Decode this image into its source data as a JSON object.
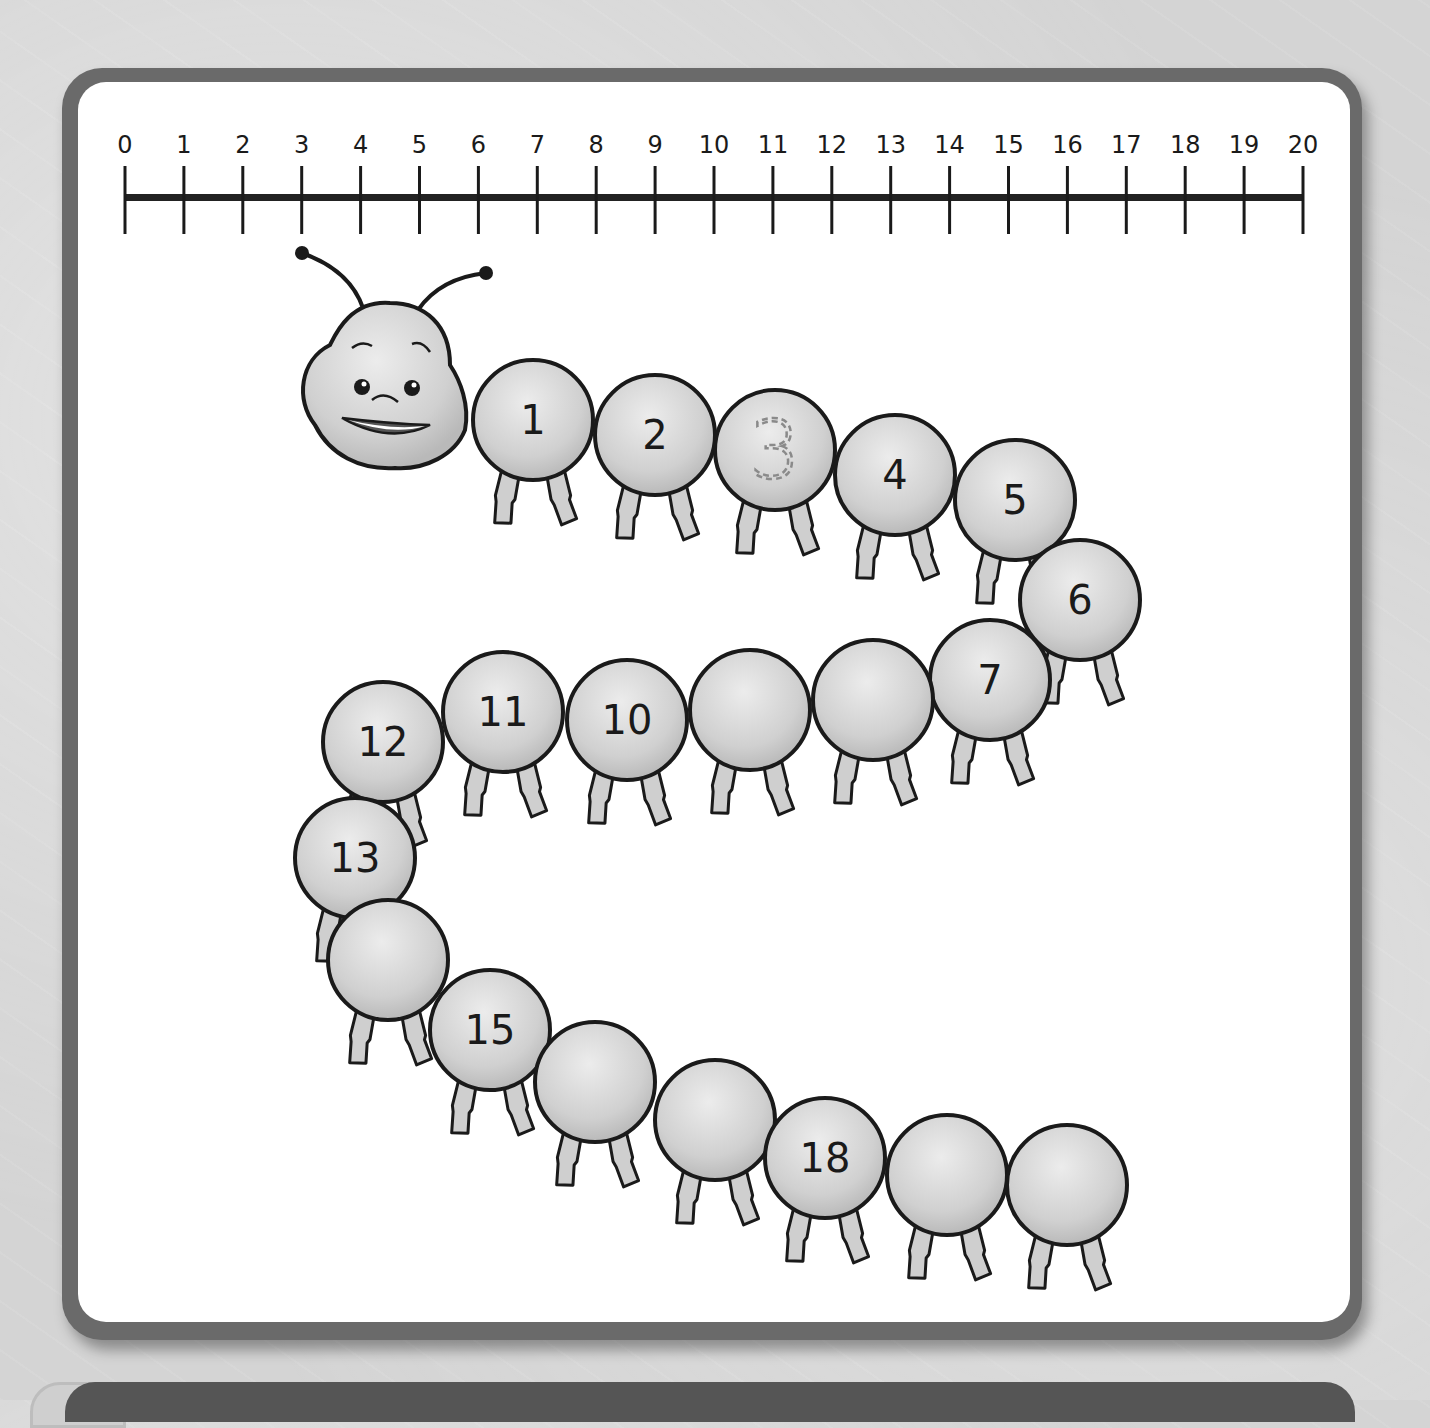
{
  "number_line": {
    "min": 0,
    "max": 20,
    "labels": [
      "0",
      "1",
      "2",
      "3",
      "4",
      "5",
      "6",
      "7",
      "8",
      "9",
      "10",
      "11",
      "12",
      "13",
      "14",
      "15",
      "16",
      "17",
      "18",
      "19",
      "20"
    ]
  },
  "caterpillar": {
    "head": {
      "label": "caterpillar-head",
      "expression": "smiling"
    },
    "segments": [
      {
        "index": 1,
        "label": "1",
        "cx": 533,
        "cy": 420,
        "style": "solid"
      },
      {
        "index": 2,
        "label": "2",
        "cx": 655,
        "cy": 435,
        "style": "solid"
      },
      {
        "index": 3,
        "label": "3",
        "cx": 775,
        "cy": 450,
        "style": "dashed-trace"
      },
      {
        "index": 4,
        "label": "4",
        "cx": 895,
        "cy": 475,
        "style": "solid"
      },
      {
        "index": 5,
        "label": "5",
        "cx": 1015,
        "cy": 500,
        "style": "solid"
      },
      {
        "index": 6,
        "label": "6",
        "cx": 1080,
        "cy": 600,
        "style": "solid"
      },
      {
        "index": 7,
        "label": "7",
        "cx": 990,
        "cy": 680,
        "style": "solid"
      },
      {
        "index": 8,
        "label": "",
        "cx": 873,
        "cy": 700,
        "style": "blank"
      },
      {
        "index": 9,
        "label": "",
        "cx": 750,
        "cy": 710,
        "style": "blank"
      },
      {
        "index": 10,
        "label": "10",
        "cx": 627,
        "cy": 720,
        "style": "solid"
      },
      {
        "index": 11,
        "label": "11",
        "cx": 503,
        "cy": 712,
        "style": "solid"
      },
      {
        "index": 12,
        "label": "12",
        "cx": 383,
        "cy": 742,
        "style": "solid"
      },
      {
        "index": 13,
        "label": "13",
        "cx": 355,
        "cy": 858,
        "style": "solid"
      },
      {
        "index": 14,
        "label": "",
        "cx": 388,
        "cy": 960,
        "style": "blank"
      },
      {
        "index": 15,
        "label": "15",
        "cx": 490,
        "cy": 1030,
        "style": "solid"
      },
      {
        "index": 16,
        "label": "",
        "cx": 595,
        "cy": 1082,
        "style": "blank"
      },
      {
        "index": 17,
        "label": "",
        "cx": 715,
        "cy": 1120,
        "style": "blank"
      },
      {
        "index": 18,
        "label": "18",
        "cx": 825,
        "cy": 1158,
        "style": "solid"
      },
      {
        "index": 19,
        "label": "",
        "cx": 947,
        "cy": 1175,
        "style": "blank"
      },
      {
        "index": 20,
        "label": "",
        "cx": 1067,
        "cy": 1185,
        "style": "blank"
      }
    ]
  },
  "colors": {
    "segment_fill": "#d2d2d2",
    "outline": "#1a1a1a",
    "frame": "#6a6a6a",
    "background": "#d4d4d4",
    "trace_dash": "#8a8a8a"
  }
}
